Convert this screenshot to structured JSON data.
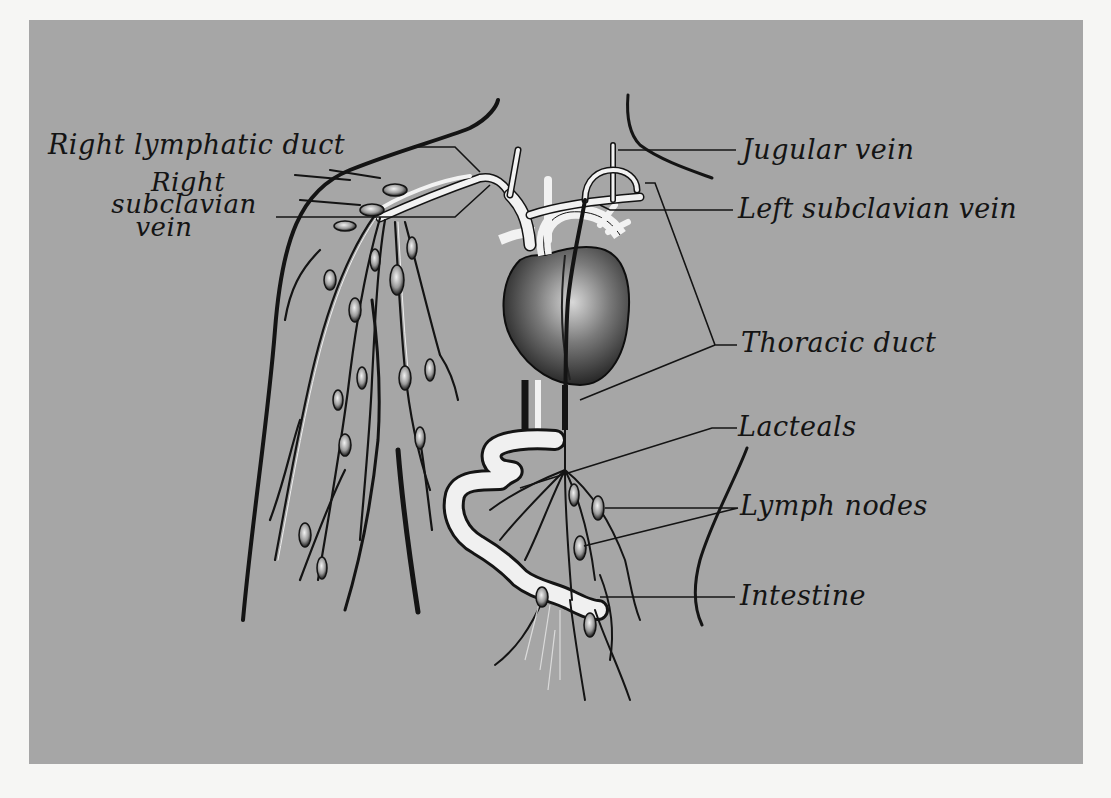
{
  "figure": {
    "background_color": "#a6a6a6",
    "page_color": "#f6f6f4",
    "ink_color": "#141414",
    "vessel_color": "#f2f2f2"
  },
  "labels": {
    "right_lymphatic_duct": "Right lymphatic duct",
    "right_subclavian_vein_line1": "Right",
    "right_subclavian_vein_line2": "subclavian",
    "right_subclavian_vein_line3": "vein",
    "jugular_vein": "Jugular vein",
    "left_subclavian_vein": "Left subclavian vein",
    "thoracic_duct": "Thoracic duct",
    "lacteals": "Lacteals",
    "lymph_nodes": "Lymph nodes",
    "intestine": "Intestine"
  },
  "structures": [
    "heart-icon",
    "jugular-vein",
    "subclavian-veins",
    "thoracic-duct",
    "right-lymphatic-duct",
    "arm-lymph-vessels",
    "lymph-nodes",
    "intestine-loop",
    "lacteals",
    "body-outline"
  ]
}
